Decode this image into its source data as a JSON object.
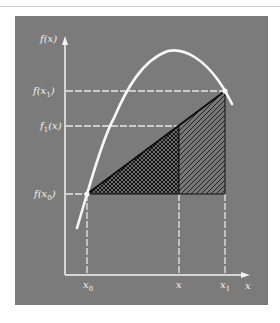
{
  "figure": {
    "background_color": "#7b7b7b",
    "line_color": "#f2f2f2",
    "hatch_color": "#1a1a1a",
    "axes": {
      "y_label": "f(x)",
      "x_label": "x"
    },
    "y_ticks": [
      {
        "id": "f_x1",
        "label": "f(x",
        "sub": "1",
        "tail": ")"
      },
      {
        "id": "f1_x",
        "label": "f",
        "sub": "1",
        "tail": "(x)"
      },
      {
        "id": "f_x0",
        "label": "f(x",
        "sub": "0",
        "tail": ")"
      }
    ],
    "x_ticks": [
      {
        "id": "x0",
        "label": "x",
        "sub": "0"
      },
      {
        "id": "x",
        "label": "x",
        "sub": ""
      },
      {
        "id": "x1",
        "label": "x",
        "sub": "1"
      }
    ],
    "regions": [
      {
        "id": "cross-hatched-triangle",
        "description": "Area under linear interpolant from x0 to x"
      },
      {
        "id": "diagonal-hatched-region",
        "description": "Area under linear interpolant from x to x1"
      }
    ]
  }
}
